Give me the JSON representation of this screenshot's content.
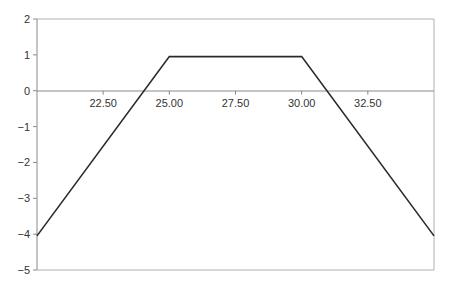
{
  "chart_data": {
    "type": "line",
    "title": "",
    "xlabel": "",
    "ylabel": "",
    "xlim": [
      20.0,
      35.0
    ],
    "ylim": [
      -5,
      2
    ],
    "grid": false,
    "legend": null,
    "x_ticks": [
      "22.50",
      "25.00",
      "27.50",
      "30.00",
      "32.50"
    ],
    "y_ticks": [
      "2",
      "1",
      "0",
      "−1",
      "−2",
      "−3",
      "−4",
      "−5"
    ],
    "series": [
      {
        "name": "payoff",
        "x": [
          20.0,
          25.0,
          30.0,
          35.0
        ],
        "y": [
          -4.05,
          0.95,
          0.95,
          -4.05
        ]
      }
    ],
    "colors": {
      "line": "#2a2a2a",
      "axis": "#8a8a8a",
      "frame": "#b0b0b0"
    }
  }
}
